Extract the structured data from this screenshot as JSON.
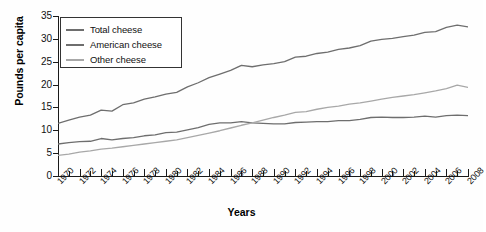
{
  "chart_data": {
    "type": "line",
    "title": "",
    "xlabel": "Years",
    "ylabel": "Pounds per capita",
    "xlim": [
      1970,
      2008
    ],
    "ylim": [
      0,
      35
    ],
    "ytick_step": 5,
    "xtick_step": 2,
    "grid": false,
    "legend_position": "top-left inside axes",
    "ytick_labels": [
      "0",
      "5",
      "10",
      "15",
      "20",
      "25",
      "30",
      "35"
    ],
    "ytick_values": [
      0,
      5,
      10,
      15,
      20,
      25,
      30,
      35
    ],
    "xtick_labels": [
      "1970",
      "1972",
      "1974",
      "1976",
      "1978",
      "1980",
      "1982",
      "1984",
      "1986",
      "1988",
      "1990",
      "1992",
      "1994",
      "1996",
      "1998",
      "2000",
      "2002",
      "2004",
      "2006",
      "2008"
    ],
    "x": [
      1970,
      1971,
      1972,
      1973,
      1974,
      1975,
      1976,
      1977,
      1978,
      1979,
      1980,
      1981,
      1982,
      1983,
      1984,
      1985,
      1986,
      1987,
      1988,
      1989,
      1990,
      1991,
      1992,
      1993,
      1994,
      1995,
      1996,
      1997,
      1998,
      1999,
      2000,
      2001,
      2002,
      2003,
      2004,
      2005,
      2006,
      2007,
      2008
    ],
    "series": [
      {
        "name": "Total cheese",
        "color": "#6e6e6e",
        "values": [
          11.5,
          12.2,
          12.9,
          13.3,
          14.4,
          14.2,
          15.6,
          16.0,
          16.8,
          17.3,
          17.9,
          18.3,
          19.5,
          20.4,
          21.5,
          22.3,
          23.1,
          24.2,
          23.9,
          24.3,
          24.6,
          25.0,
          26.0,
          26.2,
          26.8,
          27.1,
          27.7,
          28.0,
          28.5,
          29.5,
          29.9,
          30.1,
          30.5,
          30.8,
          31.4,
          31.6,
          32.5,
          33.0,
          32.6
        ]
      },
      {
        "name": "American cheese",
        "color": "#6e6e6e",
        "values": [
          7.0,
          7.3,
          7.5,
          7.6,
          8.2,
          7.9,
          8.2,
          8.4,
          8.8,
          9.0,
          9.5,
          9.6,
          10.1,
          10.6,
          11.3,
          11.6,
          11.6,
          11.9,
          11.6,
          11.5,
          11.4,
          11.4,
          11.7,
          11.8,
          11.9,
          11.9,
          12.1,
          12.1,
          12.4,
          12.8,
          12.9,
          12.8,
          12.8,
          12.9,
          13.1,
          12.9,
          13.2,
          13.3,
          13.2
        ]
      },
      {
        "name": "Other cheese",
        "color": "#a8a8a8",
        "values": [
          4.5,
          4.8,
          5.2,
          5.5,
          5.9,
          6.1,
          6.4,
          6.7,
          7.0,
          7.3,
          7.6,
          7.9,
          8.4,
          8.9,
          9.4,
          9.9,
          10.5,
          11.1,
          11.6,
          12.2,
          12.8,
          13.3,
          13.9,
          14.1,
          14.6,
          15.0,
          15.3,
          15.7,
          16.0,
          16.4,
          16.8,
          17.2,
          17.5,
          17.8,
          18.2,
          18.6,
          19.1,
          19.9,
          19.4
        ]
      }
    ],
    "legend": [
      {
        "label": "Total cheese",
        "color": "#6e6e6e"
      },
      {
        "label": "American cheese",
        "color": "#6e6e6e"
      },
      {
        "label": "Other cheese",
        "color": "#a8a8a8"
      }
    ]
  }
}
